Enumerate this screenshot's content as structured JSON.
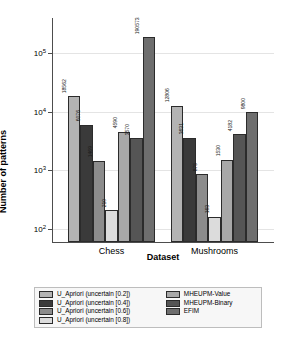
{
  "chart_data": {
    "type": "bar",
    "title": "",
    "xlabel": "Dataset",
    "ylabel": "Number of patterns",
    "yscale": "log",
    "ylim": [
      60,
      400000
    ],
    "grid": true,
    "legend_position": "bottom",
    "categories": [
      "Chess",
      "Mushrooms"
    ],
    "yticks": [
      {
        "value": 100,
        "label": "10",
        "exponent": "2"
      },
      {
        "value": 1000,
        "label": "10",
        "exponent": "3"
      },
      {
        "value": 10000,
        "label": "10",
        "exponent": "4"
      },
      {
        "value": 100000,
        "label": "10",
        "exponent": "5"
      }
    ],
    "series": [
      {
        "name": "U_Apriori (uncertain [0.2])",
        "color": "#b3b3b3",
        "values": [
          18562,
          12806
        ]
      },
      {
        "name": "U_Apriori (uncertain [0.4])",
        "color": "#3a3a3a",
        "values": [
          6076,
          3631
        ]
      },
      {
        "name": "U_Apriori (uncertain [0.6])",
        "color": "#8c8c8c",
        "values": [
          1469,
          875
        ]
      },
      {
        "name": "U_Apriori (uncertain [0.8])",
        "color": "#dcdcdc",
        "values": [
          210,
          163
        ]
      },
      {
        "name": "MHEUPM-Value",
        "color": "#a8a8a8",
        "values": [
          4590,
          1530
        ]
      },
      {
        "name": "MHEUPM-Binary",
        "color": "#555555",
        "values": [
          3570,
          4182
        ]
      },
      {
        "name": "EFIM",
        "color": "#6e6e6e",
        "values": [
          190573,
          9800
        ]
      }
    ]
  },
  "legend": {
    "columns": [
      {
        "items": [
          "U_Apriori (uncertain [0.2])",
          "U_Apriori (uncertain [0.4])",
          "U_Apriori (uncertain [0.6])",
          "U_Apriori (uncertain [0.8])"
        ]
      },
      {
        "items": [
          "MHEUPM-Value",
          "MHEUPM-Binary",
          "EFIM"
        ]
      }
    ]
  }
}
